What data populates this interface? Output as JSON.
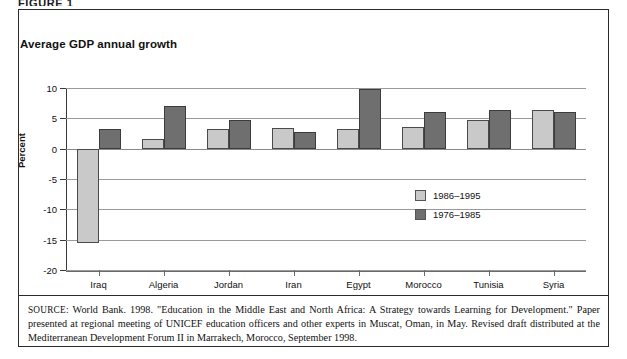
{
  "figure": {
    "label": "FIGURE 1",
    "title": "Average GDP annual growth",
    "source_tag": "SOURCE:",
    "source_text": " World Bank. 1998. \"Education in the Middle East and North Africa: A Strategy towards Learning for Development.\" Paper presented at regional meeting of UNICEF education officers and other experts in Muscat, Oman, in May. Revised draft distributed at the Mediterranean Development Forum II in Marrakech, Morocco, September 1998."
  },
  "colors": {
    "series_light": "#c9c9c9",
    "series_dark": "#6f6f6f",
    "grid": "#9a9a9a",
    "axis": "#3a3a3a",
    "frame": "#2b2b2b"
  },
  "chart_data": {
    "type": "bar",
    "title": "Average GDP annual growth",
    "xlabel": "",
    "ylabel": "Percent",
    "ylim": [
      -20,
      10
    ],
    "yticks": [
      10,
      5,
      0,
      -5,
      -10,
      -15,
      -20
    ],
    "ytick_labels": [
      "10",
      "5",
      "0",
      "-5",
      "-10",
      "-15",
      "-20"
    ],
    "grid": true,
    "legend_position": "inside-right",
    "categories": [
      "Iraq",
      "Algeria",
      "Jordan",
      "Iran",
      "Egypt",
      "Morocco",
      "Tunisia",
      "Syria"
    ],
    "series": [
      {
        "name": "1986–1995",
        "color": "#c9c9c9",
        "values": [
          -15.6,
          1.6,
          3.2,
          3.4,
          3.3,
          3.6,
          4.7,
          6.3
        ]
      },
      {
        "name": "1976–1985",
        "color": "#6f6f6f",
        "values": [
          3.3,
          7.0,
          4.8,
          2.7,
          9.8,
          6.1,
          6.4,
          6.0
        ]
      }
    ]
  }
}
